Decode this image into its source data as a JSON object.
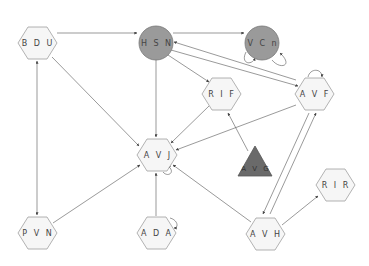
{
  "diagram": {
    "type": "directed-graph",
    "nodes": [
      {
        "id": "BDU",
        "label": "B D U",
        "shape": "hexagon",
        "x": 37,
        "y": 43,
        "fill": "#f6f6f6"
      },
      {
        "id": "HSN",
        "label": "H S N",
        "shape": "circle",
        "x": 156,
        "y": 43,
        "fill": "#9a9a9a"
      },
      {
        "id": "VCn",
        "label": "V C n",
        "shape": "circle",
        "x": 262,
        "y": 43,
        "fill": "#9a9a9a"
      },
      {
        "id": "RIF",
        "label": "R I F",
        "shape": "hexagon",
        "x": 221,
        "y": 94,
        "fill": "#f6f6f6"
      },
      {
        "id": "AVF",
        "label": "A V F",
        "shape": "hexagon",
        "x": 314,
        "y": 94,
        "fill": "#f6f6f6"
      },
      {
        "id": "AVJ",
        "label": "A V J",
        "shape": "hexagon",
        "x": 157,
        "y": 155,
        "fill": "#f6f6f6"
      },
      {
        "id": "AVG",
        "label": "A V G",
        "shape": "triangle",
        "x": 255,
        "y": 166,
        "fill": "#6a6a6a"
      },
      {
        "id": "RIR",
        "label": "R I R",
        "shape": "hexagon",
        "x": 336,
        "y": 185,
        "fill": "#f6f6f6"
      },
      {
        "id": "PVN",
        "label": "P V N",
        "shape": "hexagon",
        "x": 37,
        "y": 233,
        "fill": "#f6f6f6"
      },
      {
        "id": "ADA",
        "label": "A D A",
        "shape": "hexagon",
        "x": 156,
        "y": 233,
        "fill": "#f6f6f6"
      },
      {
        "id": "AVH",
        "label": "A V H",
        "shape": "hexagon",
        "x": 265,
        "y": 234,
        "fill": "#f6f6f6"
      }
    ],
    "edges": [
      {
        "from": "BDU",
        "to": "HSN"
      },
      {
        "from": "HSN",
        "to": "VCn"
      },
      {
        "from": "BDU",
        "to": "AVJ"
      },
      {
        "from": "BDU",
        "to": "PVN",
        "bidirectional": true
      },
      {
        "from": "HSN",
        "to": "AVJ"
      },
      {
        "from": "HSN",
        "to": "RIF"
      },
      {
        "from": "HSN",
        "to": "AVF"
      },
      {
        "from": "AVF",
        "to": "HSN"
      },
      {
        "from": "RIF",
        "to": "AVJ"
      },
      {
        "from": "AVF",
        "to": "AVJ"
      },
      {
        "from": "AVG",
        "to": "RIF"
      },
      {
        "from": "AVF",
        "to": "AVH"
      },
      {
        "from": "AVH",
        "to": "AVF"
      },
      {
        "from": "AVH",
        "to": "AVJ"
      },
      {
        "from": "AVH",
        "to": "RIR"
      },
      {
        "from": "PVN",
        "to": "AVJ"
      },
      {
        "from": "ADA",
        "to": "AVJ"
      }
    ],
    "self_loops": [
      "VCn",
      "AVF",
      "AVJ",
      "ADA"
    ]
  }
}
